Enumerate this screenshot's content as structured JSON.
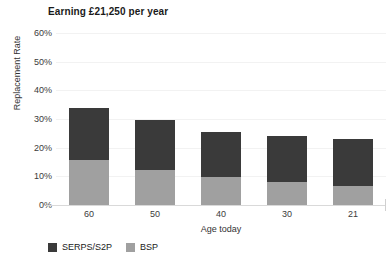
{
  "chart_data": {
    "type": "bar",
    "stacked": true,
    "title": "Earning £21,250 per year",
    "xlabel": "Age today",
    "ylabel": "Replacement Rate",
    "categories": [
      "60",
      "50",
      "40",
      "30",
      "21"
    ],
    "series": [
      {
        "name": "SERPS/S2P",
        "color": "#3a3a3a",
        "values": [
          18.3,
          17.4,
          15.7,
          16.0,
          16.4
        ]
      },
      {
        "name": "BSP",
        "color": "#a0a0a0",
        "values": [
          15.7,
          12.2,
          9.8,
          8.0,
          6.6
        ]
      }
    ],
    "totals": [
      34.0,
      29.6,
      25.5,
      24.0,
      23.0
    ],
    "ylim": [
      0,
      60
    ],
    "yticks": [
      "0%",
      "10%",
      "20%",
      "30%",
      "40%",
      "50%",
      "60%"
    ],
    "ytick_values": [
      0,
      10,
      20,
      30,
      40,
      50,
      60
    ],
    "grid": true,
    "legend_position": "bottom-left",
    "legend": [
      "SERPS/S2P",
      "BSP"
    ]
  },
  "colors": {
    "serps": "#3a3a3a",
    "bsp": "#a0a0a0",
    "gridline": "#f2f2f2",
    "axis": "#d9d9d9",
    "text": "#1a1a1a",
    "background": "#ffffff"
  }
}
